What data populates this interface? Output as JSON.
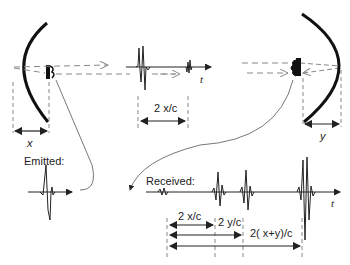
{
  "diagram": {
    "colors": {
      "ink": "#111111",
      "dashed": "#888888",
      "thin": "#444444",
      "background": "#ffffff"
    },
    "labels": {
      "top_t": "t",
      "top_interval": "2 x/c",
      "x_dist": "x",
      "y_dist": "y",
      "emitted": "Emitted:",
      "received": "Received:",
      "bottom_t": "t",
      "interval_2x": "2 x/c",
      "interval_2y": "2 y/c",
      "interval_2xy": "2( x+y)/c"
    },
    "elements": {
      "left_reflector": "curved reflector (left)",
      "left_transducer": "transducer (left)",
      "right_reflector": "curved reflector (right)",
      "right_transducer": "transducer (right)"
    }
  }
}
